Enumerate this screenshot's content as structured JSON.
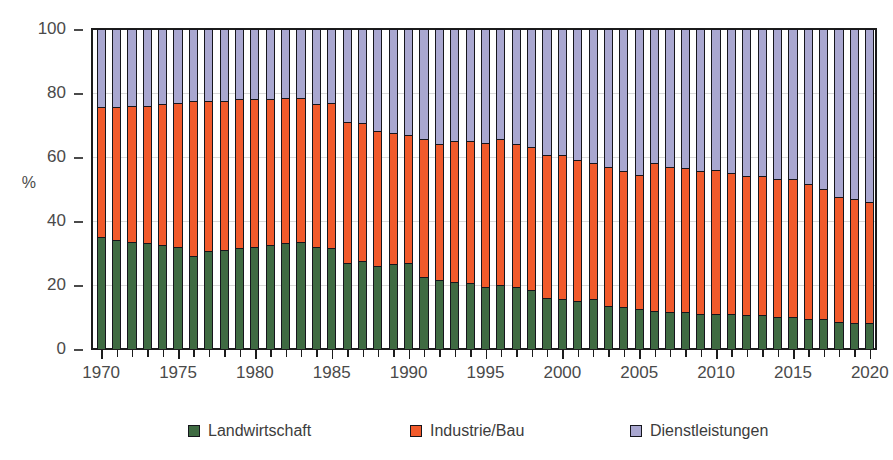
{
  "title_strip": "",
  "axes": {
    "ylabel": "%",
    "yticks": [
      0,
      20,
      40,
      60,
      80,
      100
    ],
    "ylim": [
      0,
      100
    ],
    "xlabels": [
      "1970",
      "1975",
      "1980",
      "1985",
      "1990",
      "1995",
      "2000",
      "2005",
      "2010",
      "2015",
      "2020"
    ]
  },
  "legend": {
    "items": [
      {
        "label": "Landwirtschaft",
        "color": "#3f6b42"
      },
      {
        "label": "Industrie/Bau",
        "color": "#f15a2b"
      },
      {
        "label": "Dienstleistungen",
        "color": "#a9a7d0"
      }
    ]
  },
  "chart_data": {
    "type": "bar",
    "stacked": true,
    "normalized_percent": true,
    "title": "",
    "xlabel": "",
    "ylabel": "%",
    "ylim": [
      0,
      100
    ],
    "grid": true,
    "legend_position": "bottom",
    "categories": [
      "1970",
      "1971",
      "1972",
      "1973",
      "1974",
      "1975",
      "1976",
      "1977",
      "1978",
      "1979",
      "1980",
      "1981",
      "1982",
      "1983",
      "1984",
      "1985",
      "1986",
      "1987",
      "1988",
      "1989",
      "1990",
      "1991",
      "1992",
      "1993",
      "1994",
      "1995",
      "1996",
      "1997",
      "1998",
      "1999",
      "2000",
      "2001",
      "2002",
      "2003",
      "2004",
      "2005",
      "2006",
      "2007",
      "2008",
      "2009",
      "2010",
      "2011",
      "2012",
      "2013",
      "2014",
      "2015",
      "2016",
      "2017",
      "2018",
      "2019",
      "2020"
    ],
    "series": [
      {
        "name": "Landwirtschaft",
        "color": "#3f6b42",
        "values": [
          35.0,
          34.0,
          33.5,
          33.0,
          32.5,
          32.0,
          29.0,
          30.5,
          31.0,
          31.5,
          32.0,
          32.5,
          33.0,
          33.5,
          32.0,
          31.5,
          27.0,
          27.5,
          26.0,
          26.5,
          27.0,
          22.5,
          21.5,
          21.0,
          20.5,
          19.5,
          20.0,
          19.5,
          18.5,
          16.0,
          15.5,
          15.0,
          15.5,
          13.5,
          13.0,
          12.5,
          12.0,
          11.5,
          11.5,
          11.0,
          11.0,
          11.0,
          10.5,
          10.5,
          10.0,
          10.0,
          9.5,
          9.5,
          8.5,
          8.0,
          8.0
        ]
      },
      {
        "name": "Industrie/Bau",
        "color": "#f15a2b",
        "values": [
          40.5,
          41.5,
          42.5,
          43.0,
          44.0,
          45.0,
          48.5,
          47.0,
          46.5,
          46.5,
          46.0,
          45.5,
          45.5,
          45.0,
          44.5,
          45.5,
          44.0,
          43.0,
          42.0,
          41.0,
          40.0,
          43.0,
          42.5,
          44.0,
          44.5,
          45.0,
          45.5,
          44.5,
          44.5,
          44.5,
          45.0,
          44.0,
          42.5,
          43.5,
          42.5,
          42.0,
          46.0,
          45.5,
          45.0,
          44.5,
          45.0,
          44.0,
          43.5,
          43.5,
          43.0,
          43.0,
          42.0,
          40.5,
          39.0,
          39.0,
          38.0
        ]
      },
      {
        "name": "Dienstleistungen",
        "color": "#a9a7d0",
        "values": [
          24.5,
          24.5,
          24.0,
          24.0,
          23.5,
          23.0,
          22.5,
          22.5,
          22.5,
          22.0,
          22.0,
          22.0,
          21.5,
          21.5,
          23.5,
          23.0,
          29.0,
          29.5,
          32.0,
          32.5,
          33.0,
          34.5,
          36.0,
          35.0,
          35.0,
          35.5,
          34.5,
          36.0,
          37.0,
          39.5,
          39.5,
          41.0,
          42.0,
          43.0,
          44.5,
          45.5,
          42.0,
          43.0,
          43.5,
          44.5,
          44.0,
          45.0,
          46.0,
          46.0,
          47.0,
          47.0,
          48.5,
          50.0,
          52.5,
          53.0,
          54.0
        ]
      }
    ]
  }
}
